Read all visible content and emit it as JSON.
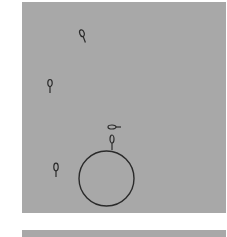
{
  "figure": {
    "panels": [
      {
        "id": "top",
        "background": "#a8a8a8",
        "objects": [
          {
            "type": "cell",
            "label": "sperm-1",
            "x": 83,
            "y": 36,
            "angle": -20
          },
          {
            "type": "cell",
            "label": "sperm-2",
            "x": 50,
            "y": 86,
            "angle": 0
          },
          {
            "type": "cell",
            "label": "sperm-3",
            "x": 115,
            "y": 127,
            "angle": -90
          },
          {
            "type": "cell",
            "label": "sperm-4",
            "x": 112,
            "y": 142,
            "angle": 0
          },
          {
            "type": "cell",
            "label": "sperm-5",
            "x": 56,
            "y": 170,
            "angle": 0
          },
          {
            "type": "egg",
            "label": "oocyte",
            "cx": 106.5,
            "cy": 178.5,
            "r": 27.5
          }
        ]
      },
      {
        "id": "bottom",
        "background": "#a8a8a8"
      }
    ],
    "stroke_color": "#2a2a2a"
  }
}
